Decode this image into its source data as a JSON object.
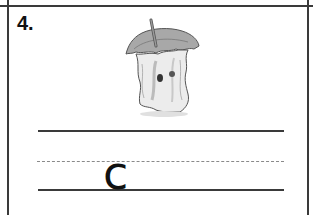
{
  "worksheet": {
    "item_number": "4.",
    "picture": "apple-core-icon",
    "handwriting": {
      "starter_letter": "c",
      "lines": [
        "solid-top",
        "dashed-middle",
        "solid-baseline"
      ]
    },
    "colors": {
      "ink": "#111111",
      "rule": "#3a3a3a",
      "dashed_rule": "#8a8a8a"
    }
  }
}
